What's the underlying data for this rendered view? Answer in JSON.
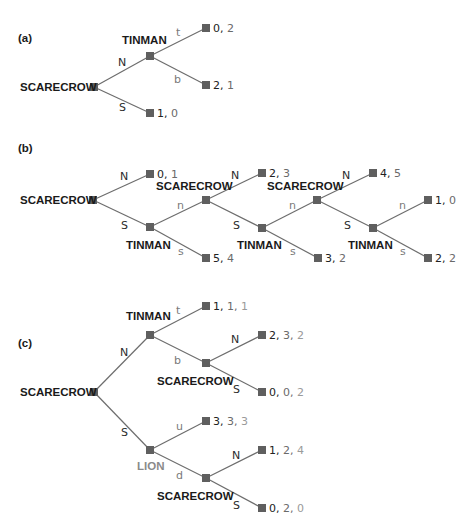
{
  "colors": {
    "edge": "#6d6d6d",
    "node": "#5f5f5f",
    "text_dark": "#1a1a1a",
    "text_mid": "#6a6a6a",
    "text_light": "#9a9a9a"
  },
  "panels": [
    {
      "label": "(a)",
      "players": {
        "root": "SCARECROW",
        "tinman": "TINMAN"
      },
      "moves": {
        "root_up": "N",
        "root_down": "S",
        "tin_up": "t",
        "tin_down": "b"
      },
      "payoffs": [
        [
          "0",
          "2"
        ],
        [
          "2",
          "1"
        ],
        [
          "1",
          "0"
        ]
      ]
    },
    {
      "label": "(b)",
      "players": {
        "root": "SCARECROW",
        "tinman1": "TINMAN",
        "scarecrow2": "SCARECROW",
        "tinman2": "TINMAN",
        "scarecrow3": "SCARECROW",
        "tinman3": "TINMAN"
      },
      "moves": {
        "N": "N",
        "S": "S",
        "n": "n",
        "s": "s"
      },
      "payoffs": [
        [
          "0",
          "1"
        ],
        [
          "5",
          "4"
        ],
        [
          "2",
          "3"
        ],
        [
          "3",
          "2"
        ],
        [
          "4",
          "5"
        ],
        [
          "1",
          "0"
        ],
        [
          "2",
          "2"
        ]
      ]
    },
    {
      "label": "(c)",
      "players": {
        "root": "SCARECROW",
        "tinman": "TINMAN",
        "scarecrow_upper": "SCARECROW",
        "lion": "LION",
        "scarecrow_lower": "SCARECROW"
      },
      "moves": {
        "root_up": "N",
        "root_down": "S",
        "tin_up": "t",
        "tin_down": "b",
        "sc_up": "N",
        "sc_down": "S",
        "lion_up": "u",
        "lion_down": "d"
      },
      "payoffs": [
        [
          "1",
          "1",
          "1"
        ],
        [
          "2",
          "3",
          "2"
        ],
        [
          "0",
          "0",
          "2"
        ],
        [
          "3",
          "3",
          "3"
        ],
        [
          "1",
          "2",
          "4"
        ],
        [
          "0",
          "2",
          "0"
        ]
      ]
    }
  ],
  "separator": ", "
}
